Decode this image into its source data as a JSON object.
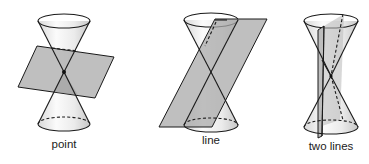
{
  "figure": {
    "panels": [
      {
        "id": "point",
        "label": "point"
      },
      {
        "id": "line",
        "label": "line"
      },
      {
        "id": "two-lines",
        "label": "two lines"
      }
    ]
  },
  "colors": {
    "background": "#ffffff",
    "outline": "#1a1a1a",
    "plane": "#a9a9a9",
    "cone_light": "#f7f7f7",
    "cone_shade": "#cfcfcf"
  }
}
